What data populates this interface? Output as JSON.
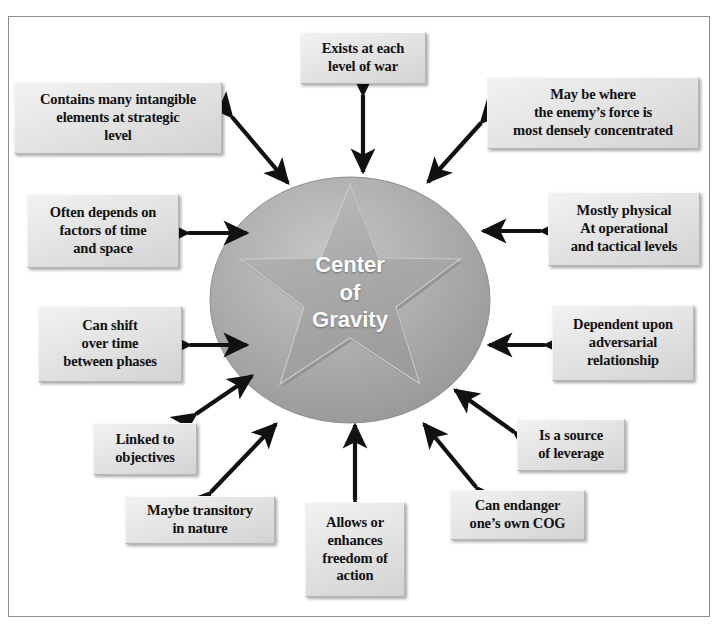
{
  "diagram": {
    "title": "Center of Gravity",
    "center": {
      "name": "center-of-gravity",
      "lines": [
        "Center",
        "of",
        "Gravity"
      ],
      "shape": "ellipse-with-embossed-five-point-star",
      "fill_color": "#a6a6a6",
      "text_color": "#ffffff"
    },
    "frame": {
      "border_color": "#8d8d8d",
      "background_color": "#ffffff"
    },
    "node_style": {
      "fill_color": "#e4e4e4",
      "border_color": "#b6b6b6",
      "text_color": "#111111"
    },
    "arrow_style": {
      "color": "#111111",
      "type": "double-headed"
    },
    "nodes": [
      {
        "id": "exists-at-each-level-of-war",
        "lines": [
          "Exists at each",
          "level of war"
        ],
        "x": 300,
        "y": 32,
        "w": 126,
        "h": 52,
        "arrow": "double"
      },
      {
        "id": "may-be-where-enemy-force-concentrated",
        "lines": [
          "May be where",
          "the enemy’s  force is",
          "most densely concentrated"
        ],
        "x": 487,
        "y": 77,
        "w": 212,
        "h": 72,
        "arrow": "double"
      },
      {
        "id": "contains-many-intangible-elements",
        "lines": [
          "Contains many intangible",
          "elements at strategic",
          "level"
        ],
        "x": 14,
        "y": 82,
        "w": 208,
        "h": 72,
        "arrow": "double"
      },
      {
        "id": "mostly-physical-operational-tactical",
        "lines": [
          "Mostly physical",
          "At operational",
          "and tactical  levels"
        ],
        "x": 548,
        "y": 192,
        "w": 152,
        "h": 74,
        "arrow": "double"
      },
      {
        "id": "often-depends-on-factors-time-space",
        "lines": [
          "Often depends on",
          "factors of time",
          "and space"
        ],
        "x": 27,
        "y": 194,
        "w": 152,
        "h": 74,
        "arrow": "double"
      },
      {
        "id": "dependent-upon-adversarial-relationship",
        "lines": [
          "Dependent upon",
          "adversarial",
          "relationship"
        ],
        "x": 552,
        "y": 305,
        "w": 142,
        "h": 76,
        "arrow": "double"
      },
      {
        "id": "can-shift-over-time-between-phases",
        "lines": [
          "Can shift",
          "over time",
          "between phases"
        ],
        "x": 38,
        "y": 306,
        "w": 144,
        "h": 76,
        "arrow": "double"
      },
      {
        "id": "is-a-source-of-leverage",
        "lines": [
          "Is a source",
          "of leverage",
          ""
        ],
        "x": 517,
        "y": 419,
        "w": 108,
        "h": 52,
        "arrow": "double"
      },
      {
        "id": "linked-to-objectives",
        "lines": [
          "Linked to",
          "objectives",
          ""
        ],
        "x": 93,
        "y": 423,
        "w": 104,
        "h": 52,
        "arrow": "double"
      },
      {
        "id": "can-endanger-ones-own-cog",
        "lines": [
          "Can endanger",
          "one’s own COG",
          ""
        ],
        "x": 450,
        "y": 490,
        "w": 135,
        "h": 50,
        "arrow": "double"
      },
      {
        "id": "maybe-transitory-in-nature",
        "lines": [
          "Maybe transitory",
          "in nature",
          ""
        ],
        "x": 125,
        "y": 496,
        "w": 150,
        "h": 48,
        "arrow": "double"
      },
      {
        "id": "allows-or-enhances-freedom-of-action",
        "lines": [
          "Allows or",
          "enhances",
          "freedom of",
          "action"
        ],
        "x": 305,
        "y": 502,
        "w": 100,
        "h": 95,
        "arrow": "double"
      }
    ]
  }
}
